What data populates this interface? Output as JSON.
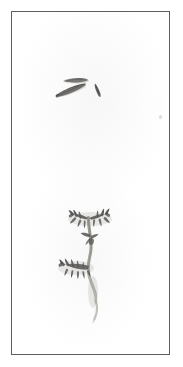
{
  "sheet": {
    "title": "Pressed botanical specimen sheet",
    "width_px": 183,
    "height_px": 367,
    "background_color": "#ffffff",
    "border_color": "#5d5d60",
    "border_width_px": 1.5,
    "margin_px": 11,
    "panel_color": "#fefefe"
  },
  "specimens": [
    {
      "id": "upper-fragments",
      "name": "Upper specimen — detached elongated pod fragments",
      "description": "Three small dark elongated pressed fragments arranged loosely, one near-horizontal above and two diagonal below",
      "color": "#4e4c4a",
      "parts": [
        {
          "label": "horizontal-pod",
          "orientation": "horizontal",
          "length_px": 22
        },
        {
          "label": "long-diagonal-pod",
          "orientation": "diagonal-down-left",
          "length_px": 30
        },
        {
          "label": "short-diagonal-pod",
          "orientation": "diagonal-down-right",
          "length_px": 14
        }
      ]
    },
    {
      "id": "lower-plant",
      "name": "Lower specimen — branching stem with compound leaves",
      "description": "A curving grey-green stem rising from the lower right with a slender tail, bearing two dark pinnate leaf clusters: an upper pair near the apex and a lower spray on the left",
      "stem_color": "#9a9a8e",
      "leaf_color": "#4a4846",
      "parts": [
        {
          "label": "apex-leaf-cluster-left",
          "type": "pinnate-leaf"
        },
        {
          "label": "apex-leaf-cluster-right",
          "type": "pinnate-leaf"
        },
        {
          "label": "mid-leaf",
          "type": "small-leaflet"
        },
        {
          "label": "lower-leaf-spray",
          "type": "pinnate-leaf"
        },
        {
          "label": "main-stem",
          "type": "stem"
        },
        {
          "label": "stem-tail",
          "type": "stem-tip"
        }
      ]
    }
  ]
}
